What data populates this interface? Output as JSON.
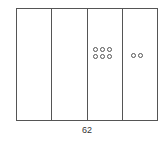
{
  "place_value_chart": {
    "columns": [
      {
        "name": "thousands",
        "count": 0
      },
      {
        "name": "hundreds",
        "count": 0
      },
      {
        "name": "tens",
        "count": 6
      },
      {
        "name": "ones",
        "count": 2
      }
    ],
    "number_label": "62"
  }
}
